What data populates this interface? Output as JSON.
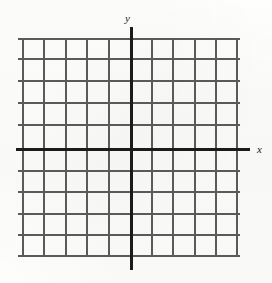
{
  "figure": {
    "width": 272,
    "height": 283,
    "background_color": "#fdfdfc",
    "grid_line_color": "#3b3b3b",
    "axis_color": "#1b1b1b"
  },
  "axes": {
    "y_axis": {
      "label": "y",
      "name": "y-axis",
      "orientation": "vertical",
      "pixel_position": 130
    },
    "x_axis": {
      "label": "x",
      "name": "x-axis",
      "orientation": "horizontal",
      "pixel_position": 148
    }
  },
  "chart_data": {
    "type": "scatter",
    "title": "",
    "subtitle": "",
    "xlabel": "x",
    "ylabel": "y",
    "grid": true,
    "legend": null,
    "annotations": [],
    "series": [],
    "x": [],
    "values": [],
    "xlim": [
      -5,
      5
    ],
    "ylim": [
      -5,
      5
    ],
    "xticks": [
      -5,
      -4,
      -3,
      -2,
      -1,
      0,
      1,
      2,
      3,
      4,
      5
    ],
    "yticks": [
      -5,
      -4,
      -3,
      -2,
      -1,
      0,
      1,
      2,
      3,
      4,
      5
    ],
    "xtick_labels": [
      "",
      "",
      "",
      "",
      "",
      "",
      "",
      "",
      "",
      "",
      ""
    ],
    "ytick_labels": [
      "",
      "",
      "",
      "",
      "",
      "",
      "",
      "",
      "",
      "",
      ""
    ],
    "vertical_gridline_count": 11,
    "horizontal_gridline_count": 11
  },
  "grid": {
    "vertical_lines": [
      {
        "id": "v0",
        "x": 22,
        "top": 38,
        "bottom": 256
      },
      {
        "id": "v1",
        "x": 43,
        "top": 38,
        "bottom": 256
      },
      {
        "id": "v2",
        "x": 65,
        "top": 38,
        "bottom": 256
      },
      {
        "id": "v3",
        "x": 86,
        "top": 38,
        "bottom": 256
      },
      {
        "id": "v4",
        "x": 108,
        "top": 38,
        "bottom": 256
      },
      {
        "id": "v5",
        "x": 151,
        "top": 38,
        "bottom": 256
      },
      {
        "id": "v6",
        "x": 172,
        "top": 38,
        "bottom": 256
      },
      {
        "id": "v7",
        "x": 194,
        "top": 38,
        "bottom": 256
      },
      {
        "id": "v8",
        "x": 215,
        "top": 38,
        "bottom": 256
      },
      {
        "id": "v9",
        "x": 236,
        "top": 38,
        "bottom": 256
      }
    ],
    "horizontal_lines": [
      {
        "id": "h0",
        "y": 38,
        "left": 18,
        "right": 240
      },
      {
        "id": "h1",
        "y": 58,
        "left": 18,
        "right": 240
      },
      {
        "id": "h2",
        "y": 80,
        "left": 18,
        "right": 240
      },
      {
        "id": "h3",
        "y": 102,
        "left": 18,
        "right": 240
      },
      {
        "id": "h4",
        "y": 124,
        "left": 18,
        "right": 240
      },
      {
        "id": "h5",
        "y": 170,
        "left": 18,
        "right": 240
      },
      {
        "id": "h6",
        "y": 191,
        "left": 18,
        "right": 240
      },
      {
        "id": "h7",
        "y": 213,
        "left": 18,
        "right": 240
      },
      {
        "id": "h8",
        "y": 234,
        "left": 18,
        "right": 240
      },
      {
        "id": "h9",
        "y": 255,
        "left": 18,
        "right": 240
      }
    ],
    "y_axis_line": {
      "x": 130,
      "top": 27,
      "bottom": 270
    },
    "x_axis_line": {
      "y": 148,
      "left": 16,
      "right": 250
    }
  },
  "labels": {
    "y_label": {
      "text": "y",
      "x": 125,
      "y": 13
    },
    "x_label": {
      "text": "x",
      "x": 257,
      "y": 144
    }
  }
}
